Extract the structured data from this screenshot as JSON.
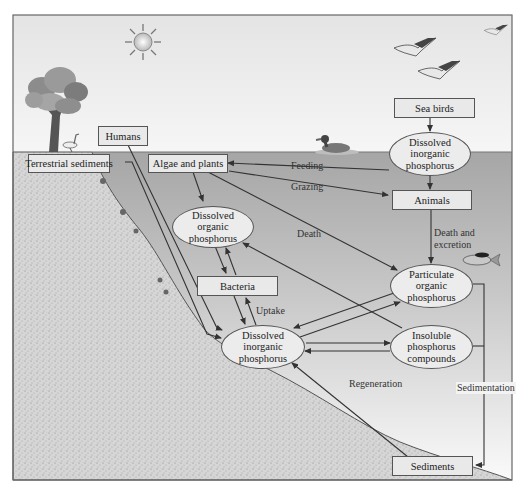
{
  "diagram": {
    "nodes": {
      "sea_birds": "Sea birds",
      "dip_top": [
        "Dissolved",
        "inorganic",
        "phosphorus"
      ],
      "humans": "Humans",
      "terrestrial_sediments": "Terrestrial sediments",
      "algae_plants": "Algae and plants",
      "animals": "Animals",
      "dop": [
        "Dissolved",
        "organic",
        "phosphorus"
      ],
      "bacteria": "Bacteria",
      "pop": [
        "Particulate",
        "organic",
        "phosphorus"
      ],
      "dip_bottom": [
        "Dissolved",
        "inorganic",
        "phosphorus"
      ],
      "insoluble": [
        "Insoluble",
        "phosphorus",
        "compounds"
      ],
      "sediments": "Sediments"
    },
    "edge_labels": {
      "feeding": "Feeding",
      "grazing": "Grazing",
      "death": "Death",
      "death_excretion_1": "Death and",
      "death_excretion_2": "excretion",
      "uptake": "Uptake",
      "regeneration": "Regeneration",
      "sedimentation": "Sedimentation"
    },
    "colors": {
      "sky": "#f2f2f2",
      "water_top": "#a9a9a9",
      "water_bottom": "#f4f4f4",
      "soil": "#d4d4d4",
      "box_fill": "#e9e9e9",
      "stroke": "#444444"
    },
    "illustrations": [
      "sun-icon",
      "tree-icon",
      "gull-icon",
      "flying-birds-icon",
      "duck-icon",
      "fish-icon"
    ]
  }
}
